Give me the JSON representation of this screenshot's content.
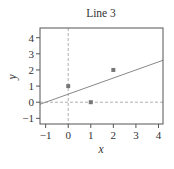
{
  "chart_data": {
    "type": "scatter",
    "title": "Line 3",
    "xlabel": "x",
    "ylabel": "y",
    "xlim": [
      -1.25,
      4.2
    ],
    "ylim": [
      -1.35,
      4.6
    ],
    "xticks": [
      -1,
      0,
      1,
      2,
      3,
      4
    ],
    "yticks": [
      -1,
      0,
      1,
      2,
      3,
      4
    ],
    "grid": false,
    "points": [
      {
        "x": 0,
        "y": 1
      },
      {
        "x": 1,
        "y": 0
      },
      {
        "x": 2,
        "y": 2
      }
    ],
    "series": [
      {
        "name": "points",
        "type": "scatter",
        "x": [
          0,
          1,
          2
        ],
        "y": [
          1,
          0,
          2
        ]
      },
      {
        "name": "fitted line",
        "type": "line",
        "slope": 0.5,
        "intercept": 0.5,
        "x": [
          -1.25,
          4.2
        ],
        "y": [
          -0.125,
          2.6
        ]
      }
    ],
    "reference_lines": [
      {
        "orientation": "vertical",
        "x": 0,
        "style": "dashed"
      },
      {
        "orientation": "horizontal",
        "y": 0,
        "style": "dashed"
      }
    ],
    "colors": {
      "frame": "#555555",
      "line": "#888888",
      "points": "#777777",
      "reference": "#b0b0b0"
    }
  }
}
